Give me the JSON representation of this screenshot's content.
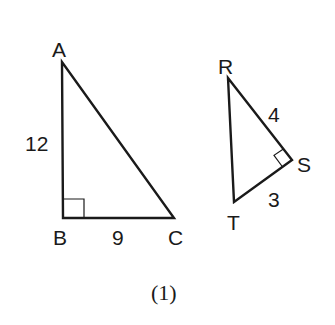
{
  "figure": {
    "caption": "(1)",
    "triangles": [
      {
        "name": "ABC",
        "vertices": {
          "A": {
            "label": "A",
            "x": 62,
            "y": 62
          },
          "B": {
            "label": "B",
            "x": 63,
            "y": 218
          },
          "C": {
            "label": "C",
            "x": 174,
            "y": 218
          }
        },
        "right_angle_at": "B",
        "sides": [
          {
            "segment": "AB",
            "length_label": "12"
          },
          {
            "segment": "BC",
            "length_label": "9"
          }
        ]
      },
      {
        "name": "RST",
        "vertices": {
          "R": {
            "label": "R",
            "x": 228,
            "y": 78
          },
          "S": {
            "label": "S",
            "x": 292,
            "y": 160
          },
          "T": {
            "label": "T",
            "x": 234,
            "y": 202
          }
        },
        "right_angle_at": "S",
        "sides": [
          {
            "segment": "RS",
            "length_label": "4"
          },
          {
            "segment": "ST",
            "length_label": "3"
          }
        ]
      }
    ]
  },
  "labels": {
    "A": "A",
    "B": "B",
    "C": "C",
    "R": "R",
    "S": "S",
    "T": "T",
    "AB": "12",
    "BC": "9",
    "RS": "4",
    "ST": "3",
    "caption": "(1)"
  }
}
